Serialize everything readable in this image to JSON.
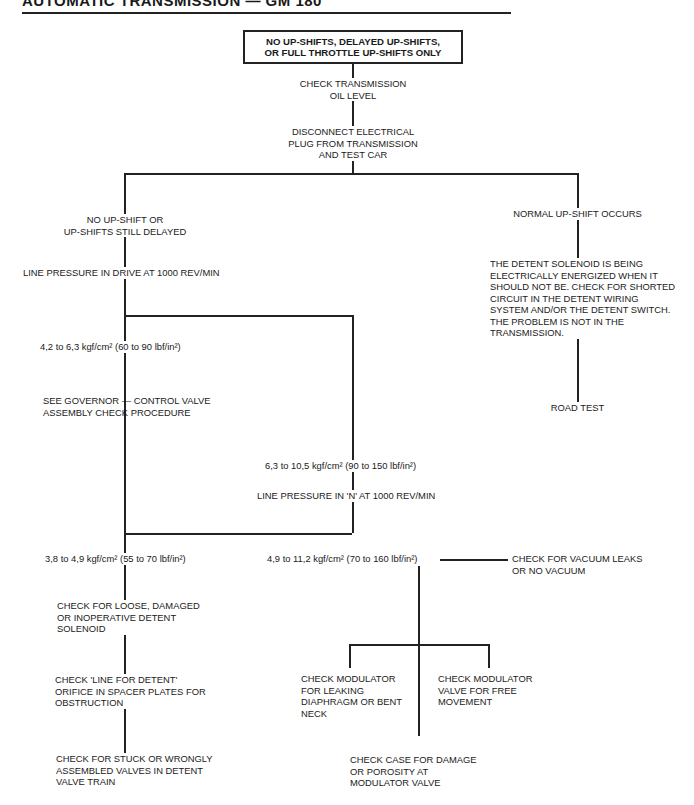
{
  "header": {
    "title": "AUTOMATIC TRANSMISSION — GM 180"
  },
  "flowchart": {
    "start": "NO UP-SHIFTS, DELAYED UP-SHIFTS,\nOR FULL THROTTLE UP-SHIFTS ONLY",
    "step1": "CHECK TRANSMISSION\nOIL LEVEL",
    "step2": "DISCONNECT ELECTRICAL\nPLUG FROM TRANSMISSION\nAND TEST CAR",
    "left": {
      "result": "NO UP-SHIFT OR\nUP-SHIFTS STILL DELAYED",
      "test": "LINE PRESSURE IN DRIVE AT 1000 REV/MIN",
      "low": {
        "reading": "4,2 to 6,3 kgf/cm² (60 to 90 lbf/in²)",
        "action": "SEE GOVERNOR — CONTROL VALVE\nASSEMBLY CHECK PROCEDURE"
      },
      "high": {
        "reading": "6,3 to 10,5 kgf/cm² (90 to 150 lbf/in²)",
        "test": "LINE PRESSURE IN 'N' AT 1000 REV/MIN",
        "branch_a": {
          "reading": "3,8 to 4,9 kgf/cm² (55 to 70 lbf/in²)",
          "check1": "CHECK FOR LOOSE, DAMAGED\nOR INOPERATIVE DETENT\nSOLENOID",
          "check2": "CHECK 'LINE FOR DETENT'\nORIFICE IN SPACER PLATES FOR\nOBSTRUCTION",
          "check3": "CHECK FOR STUCK OR WRONGLY\nASSEMBLED VALVES IN DETENT\nVALVE TRAIN"
        },
        "branch_b": {
          "reading": "4,9 to 11,2 kgf/cm² (70 to 160 lbf/in²)",
          "side": "CHECK FOR VACUUM LEAKS\nOR NO VACUUM",
          "check_left": "CHECK MODULATOR\nFOR LEAKING\nDIAPHRAGM OR BENT\nNECK",
          "check_right": "CHECK MODULATOR\nVALVE FOR FREE\nMOVEMENT",
          "check_center": "CHECK CASE FOR DAMAGE\nOR POROSITY AT\nMODULATOR VALVE"
        }
      }
    },
    "right": {
      "result": "NORMAL UP-SHIFT OCCURS",
      "diagnosis": "THE DETENT SOLENOID IS BEING\nELECTRICALLY ENERGIZED WHEN IT\nSHOULD NOT BE. CHECK FOR SHORTED\nCIRCUIT IN THE DETENT WIRING\nSYSTEM AND/OR THE DETENT SWITCH.\nTHE PROBLEM IS NOT IN THE\nTRANSMISSION.",
      "final": "ROAD TEST"
    }
  }
}
